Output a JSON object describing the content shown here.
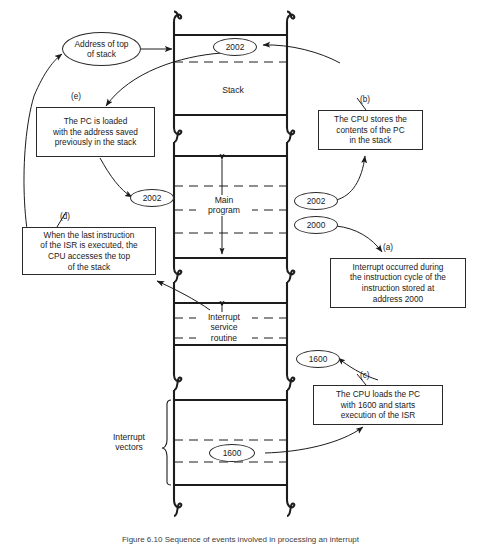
{
  "figure": {
    "caption": "Figure 6.10   Sequence of events involved in processing an interrupt"
  },
  "memory": {
    "regions": [
      {
        "id": "stack",
        "label": "Stack"
      },
      {
        "id": "main-program",
        "label": "Main\nprogram"
      },
      {
        "id": "isr",
        "label": "Interrupt\nservice\nroutine"
      }
    ],
    "interrupt_vectors_label": "Interrupt\nvectors"
  },
  "ovals": [
    {
      "id": "address-of-top-of-stack",
      "text": "Address of top\nof stack"
    },
    {
      "id": "stack-top-value",
      "text": "2002"
    },
    {
      "id": "restored-pc-value",
      "text": "2002"
    },
    {
      "id": "saved-pc-value",
      "text": "2002"
    },
    {
      "id": "current-pc-value",
      "text": "2000"
    },
    {
      "id": "isr-vector-value",
      "text": "1600"
    },
    {
      "id": "vector-table-value",
      "text": "1600"
    }
  ],
  "callouts": [
    {
      "id": "a",
      "tag": "(a)",
      "text": "Interrupt occurred during\nthe instruction cycle of the\ninstruction stored at\naddress 2000"
    },
    {
      "id": "b",
      "tag": "(b)",
      "text": "The CPU stores the\ncontents of the PC\nin the stack"
    },
    {
      "id": "c",
      "tag": "(c)",
      "text": "The CPU loads the PC\nwith 1600 and starts\nexecution of the ISR"
    },
    {
      "id": "d",
      "tag": "(d)",
      "text": "When the last instruction\nof the ISR is executed, the\nCPU accesses the top\nof the stack"
    },
    {
      "id": "e",
      "tag": "(e)",
      "text": "The PC is loaded\nwith the address saved\npreviously in the stack"
    }
  ],
  "colors": {
    "ink": "#1c1c1c",
    "background": "#ffffff"
  }
}
